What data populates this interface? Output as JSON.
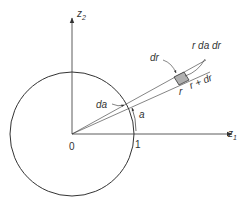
{
  "diagram": {
    "type": "polar-coordinate-area-element",
    "axes": {
      "horizontal": {
        "label": "z",
        "subscript": "1"
      },
      "vertical": {
        "label": "z",
        "subscript": "2"
      }
    },
    "origin_label": "0",
    "unit_tick_label": "1",
    "angle_label": "a",
    "angle_increment_label": "da",
    "element_labels": {
      "radial_width": "dr",
      "area": "r da dr",
      "inner_radius": "r",
      "outer_radius": "r + dr"
    },
    "colors": {
      "stroke": "#333333",
      "element_fill": "#b0b0b0"
    }
  }
}
